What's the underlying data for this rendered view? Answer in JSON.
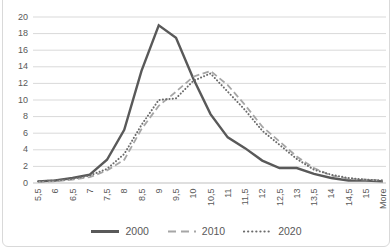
{
  "chart": {
    "title_clipped": "Histogram of average rating distribution",
    "y_tick_labels": [
      "0",
      "2",
      "4",
      "6",
      "8",
      "10",
      "12",
      "14",
      "16",
      "18",
      "20"
    ]
  },
  "chart_data": {
    "type": "line",
    "categories": [
      "5,5",
      "6",
      "6,5",
      "7",
      "7,5",
      "8",
      "8,5",
      "9",
      "9,5",
      "10",
      "10,5",
      "11",
      "11,5",
      "12",
      "12,5",
      "13",
      "13,5",
      "14",
      "14,5",
      "15",
      "More"
    ],
    "series": [
      {
        "name": "2000",
        "style": "solid",
        "color": "#595959",
        "values": [
          0.2,
          0.3,
          0.6,
          1.0,
          2.8,
          6.4,
          13.5,
          19.0,
          17.5,
          12.6,
          8.3,
          5.5,
          4.2,
          2.7,
          1.8,
          1.8,
          1.1,
          0.6,
          0.3,
          0.3,
          0.2
        ]
      },
      {
        "name": "2010",
        "style": "dashed",
        "color": "#a6a6a6",
        "values": [
          0.1,
          0.2,
          0.4,
          0.7,
          1.5,
          2.8,
          6.5,
          9.3,
          11.0,
          12.8,
          13.5,
          11.8,
          9.4,
          6.8,
          5.0,
          3.2,
          1.8,
          0.9,
          0.5,
          0.4,
          0.3
        ]
      },
      {
        "name": "2020",
        "style": "dotted",
        "color": "#6b6b6b",
        "values": [
          0.2,
          0.3,
          0.5,
          0.9,
          1.7,
          3.5,
          7.0,
          10.0,
          10.2,
          12.3,
          13.2,
          11.0,
          8.8,
          6.3,
          4.6,
          2.9,
          1.6,
          1.0,
          0.6,
          0.4,
          0.3
        ]
      }
    ],
    "xlabel": "",
    "ylabel": "",
    "ylim": [
      0,
      20
    ],
    "y_tick_step": 2,
    "grid": true,
    "gridline_color": "#d9d9d9",
    "axis_line_color": "#bfbfbf",
    "legend_position": "bottom"
  }
}
